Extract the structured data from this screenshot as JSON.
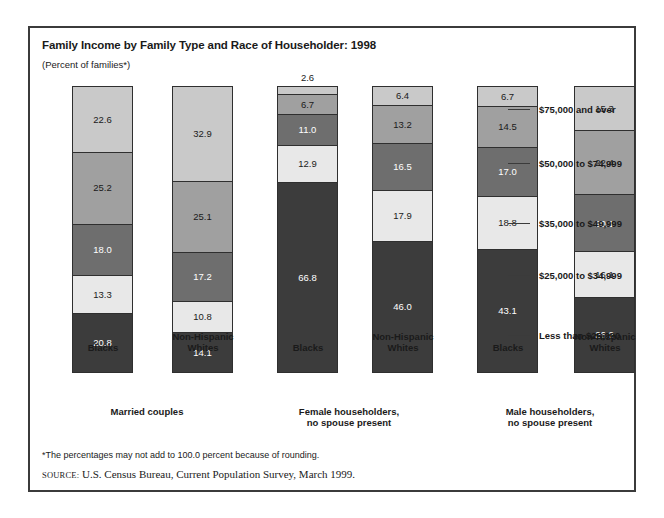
{
  "figure": {
    "title": "Family Income by Family Type and Race of Householder: 1998",
    "subtitle": "(Percent of families*)",
    "footnote": "*The percentages may not add to 100.0 percent because of rounding.",
    "source_word": "source:",
    "source_text": "U.S. Census Bureau, Current Population Survey, March 1999."
  },
  "colors": {
    "band_75_and_over": "#c9c9c9",
    "band_50_to_74": "#a0a0a0",
    "band_35_to_49": "#6e6e6e",
    "band_25_to_34": "#e8e8e8",
    "band_less_25": "#3c3c3c",
    "frame": "#3b3b3b",
    "bar_outline": "#2f2f2f",
    "background": "#ffffff"
  },
  "legend": {
    "position": "right",
    "items": [
      {
        "label": "$75,000 and over",
        "color": "#c9c9c9"
      },
      {
        "label": "$50,000 to $74,999",
        "color": "#a0a0a0"
      },
      {
        "label": "$35,000 to $49,999",
        "color": "#6e6e6e"
      },
      {
        "label": "$25,000 to $34,999",
        "color": "#e8e8e8"
      },
      {
        "label": "Less than $25,000",
        "color": "#3c3c3c"
      }
    ]
  },
  "groups": [
    {
      "tier_label": "Married couples",
      "bars": [
        {
          "race": "Blacks"
        },
        {
          "race": "Non-Hispanic\nWhites"
        }
      ]
    },
    {
      "tier_label": "Female householders,\nno spouse present",
      "bars": [
        {
          "race": "Blacks"
        },
        {
          "race": "Non-Hispanic\nWhites"
        }
      ]
    },
    {
      "tier_label": "Male householders,\nno spouse present",
      "bars": [
        {
          "race": "Blacks"
        },
        {
          "race": "Non-Hispanic\nWhites"
        }
      ]
    }
  ],
  "chart_data": {
    "type": "bar",
    "subtype": "stacked-vertical-100percent",
    "title": "Family Income by Family Type and Race of Householder: 1998",
    "subtitle": "(Percent of families*)",
    "xlabel": "",
    "ylabel": "Percent of families",
    "ylim": [
      0,
      100
    ],
    "grid": false,
    "legend_position": "right",
    "categories": [
      "Married couples — Blacks",
      "Married couples — Non-Hispanic Whites",
      "Female householders, no spouse present — Blacks",
      "Female householders, no spouse present — Non-Hispanic Whites",
      "Male householders, no spouse present — Blacks",
      "Male householders, no spouse present — Non-Hispanic Whites"
    ],
    "series": [
      {
        "name": "$75,000 and over",
        "color": "#c9c9c9",
        "values": [
          22.6,
          32.9,
          2.6,
          6.4,
          6.7,
          15.3
        ]
      },
      {
        "name": "$50,000 to $74,999",
        "color": "#a0a0a0",
        "values": [
          25.2,
          25.1,
          6.7,
          13.2,
          14.5,
          22.4
        ]
      },
      {
        "name": "$35,000 to $49,999",
        "color": "#6e6e6e",
        "values": [
          18.0,
          17.2,
          11.0,
          16.5,
          17.0,
          20.1
        ]
      },
      {
        "name": "$25,000 to $34,999",
        "color": "#e8e8e8",
        "values": [
          13.3,
          10.8,
          12.9,
          17.9,
          18.8,
          16.1
        ]
      },
      {
        "name": "Less than $25,000",
        "color": "#3c3c3c",
        "values": [
          20.8,
          14.1,
          66.8,
          46.0,
          43.1,
          26.2
        ]
      }
    ],
    "annotations": [
      "The 2.6 value for Female householders — Blacks is labeled outside (above) the bar."
    ],
    "source": "U.S. Census Bureau, Current Population Survey, March 1999.",
    "footnote": "*The percentages may not add to 100.0 percent because of rounding."
  }
}
